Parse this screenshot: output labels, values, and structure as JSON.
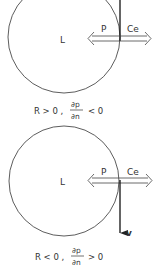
{
  "panels": [
    {
      "region_label": "L",
      "arrow_left_label": "P",
      "arrow_right_label": "Ce",
      "caption": {
        "prefix": "R > 0 ,",
        "numerator": "∂p",
        "denominator": "∂n",
        "suffix": "< 0"
      }
    },
    {
      "region_label": "L",
      "arrow_left_label": "P",
      "arrow_right_label": "Ce",
      "velocity_label": "v",
      "caption": {
        "prefix": "R < 0 ,",
        "numerator": "∂p",
        "denominator": "∂n",
        "suffix": "> 0"
      }
    }
  ],
  "colors": {
    "line": "#222222",
    "text": "#333333",
    "background": "#ffffff"
  }
}
